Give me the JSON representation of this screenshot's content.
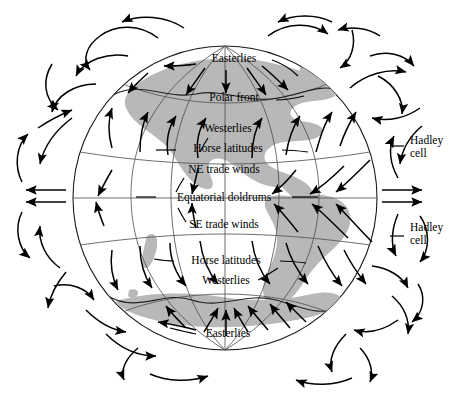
{
  "figure": {
    "type": "diagram",
    "background_color": "#ffffff",
    "land_color": "#b8b8b8",
    "line_color": "#000000"
  },
  "labels": {
    "north_easterlies": "Easterlies",
    "north_polar_front": "Polar front",
    "north_westerlies": "Westerlies",
    "north_horse_latitudes": "Horse latitudes",
    "ne_trade_winds": "NE trade winds",
    "equatorial_doldrums": "Equatorial doldrums",
    "se_trade_winds": "SE trade winds",
    "south_horse_latitudes": "Horse latitudes",
    "south_westerlies": "Westerlies",
    "south_easterlies": "Easterlies",
    "hadley_cell_north_line1": "Hadley",
    "hadley_cell_north_line2": "cell",
    "hadley_cell_south_line1": "Hadley",
    "hadley_cell_south_line2": "cell"
  },
  "label_positions": {
    "north_easterlies": {
      "x": 234,
      "y": 62
    },
    "north_polar_front": {
      "x": 234,
      "y": 101
    },
    "north_westerlies": {
      "x": 228,
      "y": 132
    },
    "north_horse_latitudes": {
      "x": 228,
      "y": 152
    },
    "ne_trade_winds": {
      "x": 224,
      "y": 173
    },
    "equatorial_doldrums": {
      "x": 224,
      "y": 200
    },
    "se_trade_winds": {
      "x": 224,
      "y": 228
    },
    "south_horse_latitudes": {
      "x": 226,
      "y": 263
    },
    "south_westerlies": {
      "x": 226,
      "y": 283
    },
    "south_easterlies": {
      "x": 228,
      "y": 336
    },
    "hadley_cell_north": {
      "x": 424,
      "y": 146
    },
    "hadley_cell_south": {
      "x": 424,
      "y": 233
    }
  },
  "globe": {
    "center_x": 225,
    "center_y": 198,
    "radius": 153,
    "meridian_count": 5,
    "latitude_bands": [
      "arctic",
      "polar front north",
      "horse latitudes north",
      "equator",
      "horse latitudes south",
      "polar front south",
      "antarctic"
    ]
  },
  "circulation": {
    "cells": [
      {
        "name": "polar-cell-north",
        "hemisphere": "north"
      },
      {
        "name": "ferrel-cell-north",
        "hemisphere": "north"
      },
      {
        "name": "hadley-cell-north",
        "hemisphere": "north"
      },
      {
        "name": "hadley-cell-south",
        "hemisphere": "south"
      },
      {
        "name": "ferrel-cell-south",
        "hemisphere": "south"
      },
      {
        "name": "polar-cell-south",
        "hemisphere": "south"
      }
    ],
    "equator_outflow_arrow_count": 2
  }
}
